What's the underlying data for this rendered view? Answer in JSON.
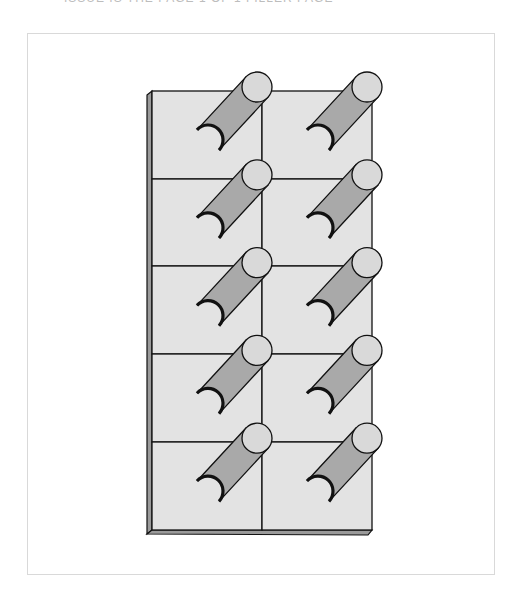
{
  "header": {
    "cut_off_caption": "ISSUE IS THE PAGE 1 OF 1 FILLER PAGE"
  },
  "figure": {
    "columns": 2,
    "rows": 5,
    "colors": {
      "tile_face": "#e3e3e3",
      "side_panel": "#9a9a9a",
      "cylinder_body": "#a9a9a9",
      "cylinder_cap": "#d9d9d9",
      "outline": "#111111",
      "frame_border": "#d9d9d9"
    }
  }
}
